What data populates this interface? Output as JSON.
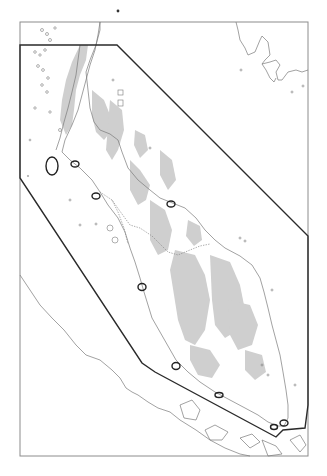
{
  "map": {
    "type": "regional-map",
    "region": "Malay Peninsula",
    "style": {
      "background": "#ffffff",
      "coastline_color": "#7a7a7a",
      "highland_fill": "#cfcfcf",
      "study_area_stroke": "#2a2a2a",
      "frame_stroke": "#8c8c8c",
      "site_marker_stroke": "#222222"
    },
    "frame": {
      "x": 20,
      "y": 22,
      "width": 288,
      "height": 434
    },
    "top_marker": {
      "x": 118,
      "y": 11
    },
    "study_area_polygon": [
      [
        20,
        45
      ],
      [
        117,
        45
      ],
      [
        308,
        236
      ],
      [
        308,
        405
      ],
      [
        305,
        428
      ],
      [
        283,
        430
      ],
      [
        276,
        437
      ],
      [
        155,
        372
      ],
      [
        142,
        363
      ],
      [
        20,
        178
      ]
    ],
    "sites": [
      {
        "id": "site-1",
        "cx": 52,
        "cy": 166,
        "rx": 6,
        "ry": 9
      },
      {
        "id": "site-2",
        "cx": 75,
        "cy": 164,
        "rx": 4,
        "ry": 3
      },
      {
        "id": "site-3",
        "cx": 96,
        "cy": 196,
        "rx": 4,
        "ry": 3
      },
      {
        "id": "site-4",
        "cx": 171,
        "cy": 204,
        "rx": 4,
        "ry": 3
      },
      {
        "id": "site-5",
        "cx": 142,
        "cy": 287,
        "rx": 4,
        "ry": 3.5
      },
      {
        "id": "site-6",
        "cx": 176,
        "cy": 366,
        "rx": 4,
        "ry": 3.5
      },
      {
        "id": "site-7",
        "cx": 219,
        "cy": 395,
        "rx": 4,
        "ry": 2.5
      },
      {
        "id": "site-8",
        "cx": 274,
        "cy": 427,
        "rx": 3.5,
        "ry": 2.5
      },
      {
        "id": "site-9",
        "cx": 284,
        "cy": 423,
        "rx": 4,
        "ry": 3
      }
    ],
    "labels": []
  }
}
